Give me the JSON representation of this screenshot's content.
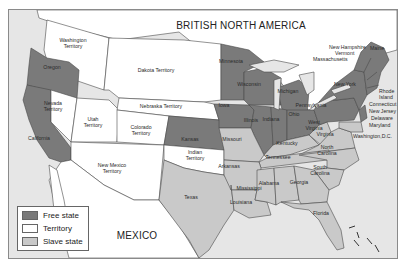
{
  "map": {
    "title": "BRITISH NORTH AMERICA",
    "south_label": "MEXICO",
    "colors": {
      "free_state": "#7a7a7a",
      "territory": "#ffffff",
      "slave_state": "#c9c9c9",
      "water": "#e6e6e6",
      "border": "#4a4a4a"
    },
    "legend": [
      {
        "label": "Free state",
        "color": "#7a7a7a"
      },
      {
        "label": "Territory",
        "color": "#ffffff"
      },
      {
        "label": "Slave state",
        "color": "#c9c9c9"
      }
    ],
    "free_states": [
      "Oregon",
      "California",
      "Minnesota",
      "Wisconsin",
      "Iowa",
      "Michigan",
      "Illinois",
      "Indiana",
      "Ohio",
      "Kansas",
      "Pennsylvania",
      "New York",
      "Maine",
      "New Hampshire",
      "Vermont",
      "Massachusetts",
      "Rhode Island",
      "Connecticut",
      "New Jersey"
    ],
    "territories": [
      "Washington Territory",
      "Dakota Territory",
      "Nebraska Territory",
      "Nevada Territory",
      "Utah Territory",
      "Colorado Territory",
      "New Mexico Territory",
      "Indian Territory"
    ],
    "slave_states": [
      "Missouri",
      "Kentucky",
      "West Virginia",
      "Virginia",
      "Delaware",
      "Maryland",
      "Tennessee",
      "North Carolina",
      "South Carolina",
      "Arkansas",
      "Texas",
      "Louisiana",
      "Mississippi",
      "Alabama",
      "Georgia",
      "Florida"
    ],
    "labels": {
      "washington": "Washington Territory",
      "oregon": "Oregon",
      "dakota": "Dakota Territory",
      "nebraska": "Nebraska Territory",
      "nevada": "Nevada Territory",
      "utah": "Utah Territory",
      "colorado": "Colorado Territory",
      "california": "California",
      "kansas": "Kansas",
      "new_mexico": "New Mexico Territory",
      "indian": "Indian Territory",
      "texas": "Texas",
      "minnesota": "Minnesota",
      "wisconsin": "Wisconsin",
      "iowa": "Iowa",
      "michigan": "Michigan",
      "illinois": "Illinois",
      "indiana": "Indiana",
      "ohio": "Ohio",
      "missouri": "Missouri",
      "kentucky": "Kentucky",
      "west_virginia": "West Virginia",
      "virginia": "Virginia",
      "tennessee": "Tennessee",
      "north_carolina": "North Carolina",
      "south_carolina": "South Carolina",
      "arkansas": "Arkansas",
      "louisiana": "Louisiana",
      "mississippi": "Mississippi",
      "alabama": "Alabama",
      "georgia": "Georgia",
      "florida": "Florida",
      "pennsylvania": "Pennsylvania",
      "new_york": "New York",
      "maine": "Maine",
      "new_hampshire": "New Hampshire",
      "vermont": "Vermont",
      "massachusetts": "Massachusetts",
      "rhode_island": "Rhode Island",
      "connecticut": "Connecticut",
      "new_jersey": "New Jersey",
      "delaware": "Delaware",
      "maryland": "Maryland",
      "washington_dc": "Washington,D.C."
    }
  }
}
